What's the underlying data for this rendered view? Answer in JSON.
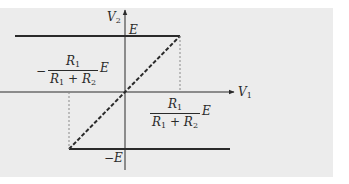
{
  "diagram": {
    "axes": {
      "x_label": "V",
      "x_label_sub": "1",
      "y_label": "V",
      "y_label_sub": "2"
    },
    "levels": {
      "top": "E",
      "bottom": "−E"
    },
    "threshold_left": {
      "sign": "−",
      "numerator": "R",
      "numerator_sub": "1",
      "denominator_a": "R",
      "denominator_a_sub": "1",
      "denominator_plus": " + ",
      "denominator_b": "R",
      "denominator_b_sub": "2",
      "factor": "E"
    },
    "threshold_right": {
      "numerator": "R",
      "numerator_sub": "1",
      "denominator_a": "R",
      "denominator_a_sub": "1",
      "denominator_plus": " + ",
      "denominator_b": "R",
      "denominator_b_sub": "2",
      "factor": "E"
    },
    "colors": {
      "background": "#ececec",
      "line": "#2a2a2a",
      "guide": "#8a8a8a"
    }
  }
}
